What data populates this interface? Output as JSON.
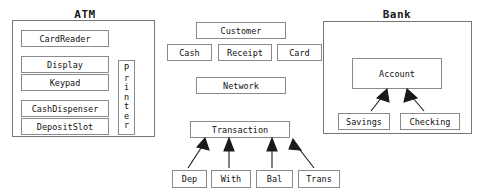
{
  "diagram": {
    "title_atm": "ATM",
    "title_bank": "Bank",
    "packages": [
      {
        "name": "atm-package",
        "label": "ATM",
        "x": 12,
        "y": 20,
        "w": 143,
        "h": 117
      },
      {
        "name": "bank-package",
        "label": "Bank",
        "x": 323,
        "y": 21,
        "w": 149,
        "h": 113
      }
    ],
    "classes": {
      "card_reader": "CardReader",
      "display": "Display",
      "keypad": "Keypad",
      "cash_dispenser": "CashDispenser",
      "deposit_slot": "DepositSlot",
      "printer": "Printer",
      "printer_letters": [
        "P",
        "r",
        "i",
        "n",
        "t",
        "e",
        "r"
      ],
      "customer": "Customer",
      "cash": "Cash",
      "receipt": "Receipt",
      "card": "Card",
      "network": "Network",
      "transaction": "Transaction",
      "dep": "Dep",
      "with": "With",
      "bal": "Bal",
      "trans": "Trans",
      "account": "Account",
      "savings": "Savings",
      "checking": "Checking"
    },
    "colors": {
      "background": "#ffffff",
      "package_border": "#767676",
      "class_border": "#8a8a8a",
      "text": "#111111",
      "arrow": "#1a1a1a"
    },
    "relations": [
      {
        "from": "Dep",
        "to": "Transaction",
        "type": "generalization"
      },
      {
        "from": "With",
        "to": "Transaction",
        "type": "generalization"
      },
      {
        "from": "Bal",
        "to": "Transaction",
        "type": "generalization"
      },
      {
        "from": "Trans",
        "to": "Transaction",
        "type": "generalization"
      },
      {
        "from": "Savings",
        "to": "Account",
        "type": "generalization"
      },
      {
        "from": "Checking",
        "to": "Account",
        "type": "generalization"
      }
    ]
  }
}
